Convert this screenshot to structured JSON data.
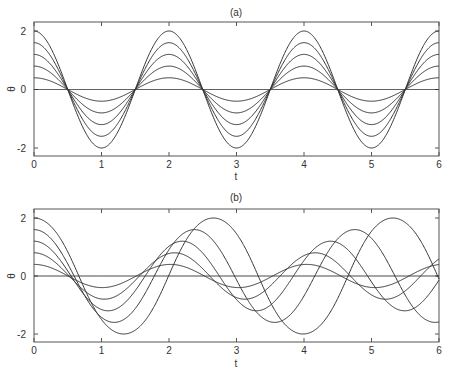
{
  "chart_data": [
    {
      "type": "line",
      "title": "(a)",
      "xlabel": "t",
      "ylabel": "θ",
      "xlim": [
        0,
        6
      ],
      "ylim": [
        -2.3,
        2.3
      ],
      "xticks": [
        "0",
        "1",
        "2",
        "3",
        "4",
        "5",
        "6"
      ],
      "yticks": [
        "-2",
        "0",
        "2"
      ],
      "model": "linear: θ = A·cos(πt)",
      "series": [
        {
          "name": "A=0",
          "amplitude": 0
        },
        {
          "name": "A=0.4",
          "amplitude": 0.4
        },
        {
          "name": "A=0.8",
          "amplitude": 0.8
        },
        {
          "name": "A=1.2",
          "amplitude": 1.2
        },
        {
          "name": "A=1.6",
          "amplitude": 1.6
        },
        {
          "name": "A=2.0",
          "amplitude": 2.0
        }
      ]
    },
    {
      "type": "line",
      "title": "(b)",
      "xlabel": "t",
      "ylabel": "θ",
      "xlim": [
        0,
        6
      ],
      "ylim": [
        -2.3,
        2.3
      ],
      "xticks": [
        "0",
        "1",
        "2",
        "3",
        "4",
        "5",
        "6"
      ],
      "yticks": [
        "-2",
        "0",
        "2"
      ],
      "model": "nonlinear pendulum: θ'' = -π²·sin(θ), θ(0)=A, θ'(0)=0",
      "series": [
        {
          "name": "A=0",
          "amplitude": 0
        },
        {
          "name": "A=0.4",
          "amplitude": 0.4
        },
        {
          "name": "A=0.8",
          "amplitude": 0.8
        },
        {
          "name": "A=1.2",
          "amplitude": 1.2
        },
        {
          "name": "A=1.6",
          "amplitude": 1.6
        },
        {
          "name": "A=2.0",
          "amplitude": 2.0
        }
      ]
    }
  ],
  "panels": {
    "a": {
      "title": "(a)",
      "xlabel": "t",
      "ylabel": "θ"
    },
    "b": {
      "title": "(b)",
      "xlabel": "t",
      "ylabel": "θ"
    }
  },
  "style": {
    "line_color": "#333333",
    "axis_color": "#555555"
  }
}
